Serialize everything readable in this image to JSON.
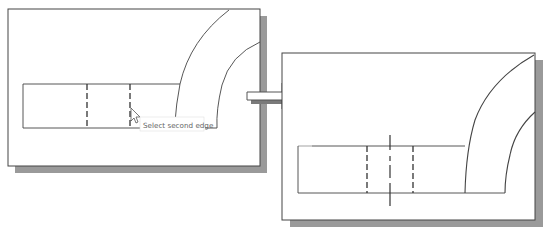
{
  "figure": {
    "colors": {
      "background": "#ffffff",
      "frame": "#444444",
      "shadow": "#9a9a9a",
      "line": "#333333",
      "tooltip_text": "#666666",
      "tooltip_border": "#cfcfcf",
      "arrow_fill": "#ffffff",
      "arrow_stroke": "#555555"
    },
    "before_panel": {
      "label": "Before: selecting edges",
      "tooltip": "Select second edge",
      "cursor": "pointer-arrow"
    },
    "transition_arrow": {
      "label": "right-arrow"
    },
    "after_panel": {
      "label": "After: center mark created"
    }
  }
}
